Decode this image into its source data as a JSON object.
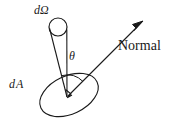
{
  "figure": {
    "background_color": "#ffffff",
    "stroke_color": "#1a1a1a",
    "width": 177,
    "height": 124,
    "labels": {
      "solid_angle": "dΩ",
      "area_element": "d A",
      "angle": "θ",
      "normal": "Normal"
    },
    "geometry": {
      "ellipse_center": [
        69,
        95
      ],
      "ellipse_rx": 31,
      "ellipse_ry": 19,
      "ellipse_rotation_deg": -25,
      "cone_apex": [
        67,
        97
      ],
      "cone_top_circle_center": [
        58,
        27
      ],
      "cone_top_circle_r": 9,
      "normal_start": [
        68,
        96
      ],
      "normal_tip": [
        143,
        21
      ],
      "angle_arc_radius": 22
    }
  }
}
